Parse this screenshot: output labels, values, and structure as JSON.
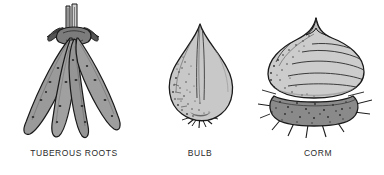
{
  "figure": {
    "background_color": "#ffffff",
    "caption_color": "#2b2b2b"
  },
  "panels": [
    {
      "id": "tuberous-roots",
      "label": "TUBEROUS ROOTS",
      "icon_name": "tuberous-roots-illustration",
      "description": "Cluster of four to five elongated tapered tuberous roots radiating from a central crown with cut stem stubs",
      "fill_color": "#9a9a9a",
      "outline_color": "#1a1a1a",
      "spot_color": "#2e2e2e",
      "tuber_count": 4,
      "stem_stub_count": 2
    },
    {
      "id": "bulb",
      "label": "BULB",
      "icon_name": "bulb-illustration",
      "description": "Teardrop shaped bulb with pointed neck, stippled left flank, vertical tunic lines and fibrous roots at the base plate",
      "fill_color": "#c8c8c8",
      "outline_color": "#1a1a1a",
      "stipple_color": "#3a3a3a",
      "root_count": 7
    },
    {
      "id": "corm",
      "label": "CORM",
      "icon_name": "corm-illustration",
      "description": "Rounded corm with pointed apex and horizontal ring scars above a darker flattened basal disc bearing roots",
      "fill_color": "#cccccc",
      "base_fill_color": "#8a8a8a",
      "outline_color": "#1a1a1a",
      "stipple_color": "#2e2e2e",
      "ring_line_count": 5,
      "root_count": 8
    }
  ]
}
